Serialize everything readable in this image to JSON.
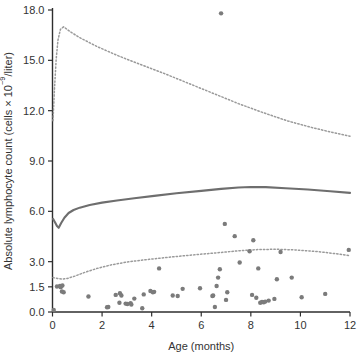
{
  "chart_data": {
    "type": "scatter",
    "title": "",
    "xlabel": "Age (months)",
    "ylabel": "Absolute lymphocyte count (cells × 10−9/liter)",
    "xlim": [
      0,
      12
    ],
    "ylim": [
      0,
      18
    ],
    "grid": false,
    "legend": "none",
    "xticks": [
      0,
      2,
      4,
      6,
      8,
      10,
      12
    ],
    "xtick_labels": [
      "0",
      "2",
      "4",
      "6",
      "8",
      "10",
      "12"
    ],
    "yticks": [
      0.0,
      1.5,
      3.0,
      6.0,
      9.0,
      12.0,
      15.0,
      18.0
    ],
    "ytick_labels": [
      "0.0",
      "1.5",
      "3.0",
      "6.0",
      "9.0",
      "12.0",
      "15.0",
      "18.0"
    ],
    "colors": {
      "point": "#7b7b7b",
      "median": "#6e6e6e",
      "percentile": "#9a9a9a",
      "axis": "#2e2e2e",
      "background": "#ffffff"
    },
    "series": [
      {
        "name": "Patient absolute lymphocyte counts",
        "type": "scatter",
        "marker": "filled-circle",
        "points": [
          [
            0.05,
            0.12
          ],
          [
            0.18,
            1.52
          ],
          [
            0.3,
            1.55
          ],
          [
            0.33,
            1.48
          ],
          [
            0.38,
            1.22
          ],
          [
            0.4,
            1.58
          ],
          [
            0.45,
            1.18
          ],
          [
            1.45,
            0.92
          ],
          [
            2.2,
            0.28
          ],
          [
            2.25,
            0.3
          ],
          [
            2.55,
            1.02
          ],
          [
            2.7,
            0.55
          ],
          [
            2.72,
            1.12
          ],
          [
            2.78,
            0.98
          ],
          [
            2.95,
            0.5
          ],
          [
            3.02,
            0.48
          ],
          [
            3.15,
            0.52
          ],
          [
            3.18,
            0.45
          ],
          [
            3.3,
            0.8
          ],
          [
            3.62,
            0.22
          ],
          [
            3.68,
            1.05
          ],
          [
            4.05,
            1.18
          ],
          [
            4.1,
            1.2
          ],
          [
            4.3,
            2.6
          ],
          [
            5.05,
            0.95
          ],
          [
            5.25,
            1.38
          ],
          [
            6.45,
            0.95
          ],
          [
            6.48,
            0.98
          ],
          [
            6.55,
            0.3
          ],
          [
            6.62,
            1.55
          ],
          [
            6.68,
            2.05
          ],
          [
            6.75,
            2.55
          ],
          [
            6.8,
            17.8
          ],
          [
            6.95,
            5.25
          ],
          [
            7.0,
            0.72
          ],
          [
            7.05,
            1.18
          ],
          [
            7.35,
            4.52
          ],
          [
            7.95,
            3.62
          ],
          [
            8.05,
            1.02
          ],
          [
            8.1,
            4.28
          ],
          [
            8.22,
            0.85
          ],
          [
            8.3,
            2.6
          ],
          [
            8.38,
            0.55
          ],
          [
            8.45,
            0.6
          ],
          [
            8.52,
            0.58
          ],
          [
            8.58,
            0.62
          ],
          [
            8.72,
            0.68
          ],
          [
            8.95,
            0.78
          ],
          [
            9.05,
            1.95
          ],
          [
            9.2,
            3.58
          ],
          [
            10.05,
            0.88
          ],
          [
            11.0,
            1.08
          ],
          [
            11.95,
            3.7
          ],
          [
            5.95,
            1.42
          ],
          [
            4.85,
            0.98
          ],
          [
            3.95,
            1.25
          ],
          [
            7.55,
            2.95
          ],
          [
            9.65,
            2.05
          ]
        ]
      },
      {
        "name": "97.5th percentile",
        "type": "line",
        "style": "dotted",
        "points": [
          [
            0.02,
            11.4
          ],
          [
            0.08,
            13.3
          ],
          [
            0.15,
            15.1
          ],
          [
            0.22,
            16.2
          ],
          [
            0.32,
            16.85
          ],
          [
            0.45,
            17.0
          ],
          [
            0.7,
            16.72
          ],
          [
            1.1,
            16.35
          ],
          [
            1.8,
            15.82
          ],
          [
            2.6,
            15.3
          ],
          [
            3.5,
            14.78
          ],
          [
            4.5,
            14.22
          ],
          [
            5.5,
            13.62
          ],
          [
            6.5,
            13.02
          ],
          [
            7.5,
            12.42
          ],
          [
            8.5,
            11.88
          ],
          [
            9.5,
            11.38
          ],
          [
            10.5,
            10.98
          ],
          [
            11.3,
            10.7
          ],
          [
            12.0,
            10.48
          ]
        ]
      },
      {
        "name": "Median",
        "type": "line",
        "style": "solid",
        "points": [
          [
            0.02,
            5.55
          ],
          [
            0.1,
            5.35
          ],
          [
            0.18,
            5.12
          ],
          [
            0.25,
            5.02
          ],
          [
            0.35,
            5.3
          ],
          [
            0.48,
            5.62
          ],
          [
            0.65,
            5.9
          ],
          [
            0.85,
            6.08
          ],
          [
            1.1,
            6.22
          ],
          [
            1.5,
            6.38
          ],
          [
            2.0,
            6.52
          ],
          [
            2.6,
            6.65
          ],
          [
            3.3,
            6.78
          ],
          [
            4.1,
            6.92
          ],
          [
            5.0,
            7.08
          ],
          [
            6.0,
            7.22
          ],
          [
            6.8,
            7.34
          ],
          [
            7.5,
            7.42
          ],
          [
            8.0,
            7.45
          ],
          [
            8.6,
            7.44
          ],
          [
            9.4,
            7.38
          ],
          [
            10.3,
            7.3
          ],
          [
            11.2,
            7.2
          ],
          [
            12.0,
            7.1
          ]
        ]
      },
      {
        "name": "2.5th percentile",
        "type": "line",
        "style": "dotted",
        "points": [
          [
            0.02,
            2.05
          ],
          [
            0.2,
            2.0
          ],
          [
            0.4,
            1.96
          ],
          [
            0.6,
            2.0
          ],
          [
            0.9,
            2.14
          ],
          [
            1.3,
            2.36
          ],
          [
            1.8,
            2.6
          ],
          [
            2.4,
            2.82
          ],
          [
            3.1,
            3.0
          ],
          [
            3.9,
            3.14
          ],
          [
            4.8,
            3.28
          ],
          [
            5.8,
            3.42
          ],
          [
            6.8,
            3.55
          ],
          [
            7.6,
            3.66
          ],
          [
            8.3,
            3.72
          ],
          [
            9.0,
            3.74
          ],
          [
            9.8,
            3.7
          ],
          [
            10.7,
            3.6
          ],
          [
            11.4,
            3.48
          ],
          [
            12.0,
            3.36
          ]
        ]
      }
    ]
  }
}
